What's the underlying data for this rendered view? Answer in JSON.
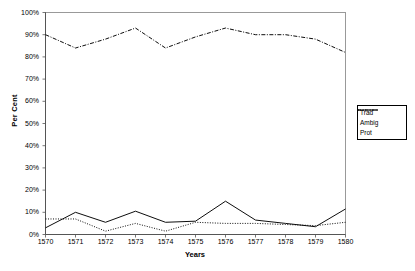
{
  "chart_data": {
    "type": "line",
    "title": "",
    "xlabel": "Years",
    "ylabel": "Per Cent",
    "categories": [
      "1570",
      "1571",
      "1572",
      "1573",
      "1574",
      "1575",
      "1576",
      "1577",
      "1578",
      "1579",
      "1580"
    ],
    "x": [
      1570,
      1571,
      1572,
      1573,
      1574,
      1575,
      1576,
      1577,
      1578,
      1579,
      1580
    ],
    "xlim": [
      1570,
      1580
    ],
    "ylim": [
      0,
      100
    ],
    "ytick_labels": [
      "0%",
      "10%",
      "20%",
      "30%",
      "40%",
      "50%",
      "60%",
      "70%",
      "80%",
      "90%",
      "100%"
    ],
    "ytick_values": [
      0,
      10,
      20,
      30,
      40,
      50,
      60,
      70,
      80,
      90,
      100
    ],
    "grid": false,
    "legend_position": "right",
    "series": [
      {
        "name": "Trad",
        "style": "dotted",
        "color": "#000000",
        "values": [
          7,
          7,
          1.5,
          5,
          1.5,
          5.5,
          5,
          5,
          4.5,
          4,
          5.5
        ]
      },
      {
        "name": "Ambig",
        "style": "dash-dot",
        "color": "#000000",
        "values": [
          90,
          84,
          88,
          93,
          84,
          89,
          93,
          90,
          90,
          88,
          82
        ]
      },
      {
        "name": "Prot",
        "style": "solid",
        "color": "#000000",
        "values": [
          3,
          10,
          5.5,
          10.5,
          5.5,
          6,
          15,
          6.5,
          5,
          3.5,
          11.5
        ]
      }
    ]
  },
  "legend": {
    "items": [
      {
        "label": "Trad",
        "style": "dotted"
      },
      {
        "label": "Ambig",
        "style": "dash-dot"
      },
      {
        "label": "Prot",
        "style": "solid"
      }
    ]
  }
}
